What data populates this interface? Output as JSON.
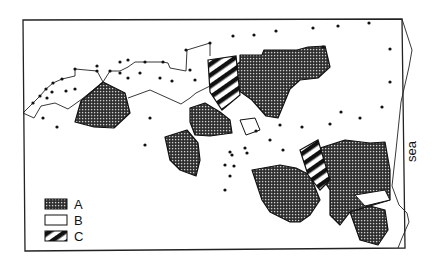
{
  "diagram": {
    "type": "map-diagram",
    "coastline_label": "sea",
    "legend": [
      {
        "key": "A",
        "label": "A",
        "pattern": "crosshatch-dark"
      },
      {
        "key": "B",
        "label": "B",
        "pattern": "blank"
      },
      {
        "key": "C",
        "label": "C",
        "pattern": "diagonal-hatch"
      }
    ],
    "colors": {
      "ink": "#111111",
      "background": "#ffffff"
    }
  }
}
